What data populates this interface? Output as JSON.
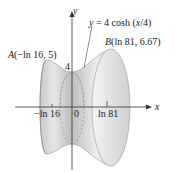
{
  "figure": {
    "curve_label": "y = 4 cosh (x/4)",
    "curve_label_parts": {
      "lhs": "y",
      "rhs": " = 4 cosh (",
      "arg": "x",
      "tail": "/4)"
    },
    "point_a": {
      "name": "A",
      "coords": "(−ln 16, 5)"
    },
    "point_b": {
      "name": "B",
      "coords": "(ln 81, 6.67)"
    },
    "y_intercept_label": "4",
    "axes": {
      "x_label": "x",
      "y_label": "y"
    },
    "x_ticks": [
      "−ln 16",
      "0",
      "ln 81"
    ]
  },
  "colors": {
    "surface_light": "#f2f2f2",
    "surface_mid": "#d4d4d4",
    "surface_dark": "#a9a9a9",
    "axis": "#333333"
  }
}
